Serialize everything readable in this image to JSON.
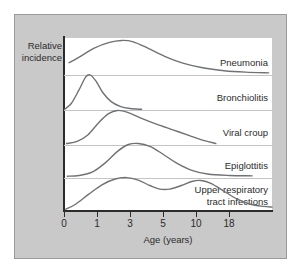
{
  "figure": {
    "background_color": "#c9c9c9",
    "panel_color": "#ffffff",
    "axis_color": "#2b2b2b",
    "curve_color": "#6f7275",
    "separator_color": "#c4c4c4"
  },
  "chart_data": {
    "type": "line",
    "title": "",
    "xlabel": "Age (years)",
    "ylabel_line1": "Relative",
    "ylabel_line2": "incidence",
    "grid": false,
    "legend_position": "right-inline",
    "x_tick_labels": [
      "0",
      "1",
      "3",
      "5",
      "10",
      "18"
    ],
    "x_tick_positions": [
      0,
      1,
      2,
      3,
      4,
      5
    ],
    "xlim": [
      0,
      6.3
    ],
    "ylim": [
      0,
      1
    ],
    "note": "Ridgeline of five age-incidence curves; x axis uses non-linear spacing with evenly spaced labels 0,1,3,5,10,18",
    "series": [
      {
        "name": "Pneumonia",
        "label": "Pneumonia",
        "band": 1,
        "peak_x_label": "2",
        "points": [
          {
            "x": 0.15,
            "y": 0.34
          },
          {
            "x": 0.5,
            "y": 0.52
          },
          {
            "x": 0.9,
            "y": 0.74
          },
          {
            "x": 1.35,
            "y": 0.9
          },
          {
            "x": 1.75,
            "y": 0.96
          },
          {
            "x": 2.1,
            "y": 0.92
          },
          {
            "x": 2.55,
            "y": 0.74
          },
          {
            "x": 3.05,
            "y": 0.52
          },
          {
            "x": 3.6,
            "y": 0.33
          },
          {
            "x": 4.2,
            "y": 0.2
          },
          {
            "x": 4.85,
            "y": 0.12
          },
          {
            "x": 5.5,
            "y": 0.08
          },
          {
            "x": 6.2,
            "y": 0.06
          }
        ]
      },
      {
        "name": "Bronchiolitis",
        "label": "Bronchiolitis",
        "band": 2,
        "peak_x_label": "under 1",
        "points": [
          {
            "x": 0.02,
            "y": 0.02
          },
          {
            "x": 0.22,
            "y": 0.18
          },
          {
            "x": 0.45,
            "y": 0.55
          },
          {
            "x": 0.66,
            "y": 0.92
          },
          {
            "x": 0.8,
            "y": 0.97
          },
          {
            "x": 0.97,
            "y": 0.8
          },
          {
            "x": 1.18,
            "y": 0.48
          },
          {
            "x": 1.42,
            "y": 0.24
          },
          {
            "x": 1.7,
            "y": 0.1
          },
          {
            "x": 2.0,
            "y": 0.04
          },
          {
            "x": 2.35,
            "y": 0.02
          }
        ]
      },
      {
        "name": "Viral croup",
        "label": "Viral croup",
        "band": 3,
        "peak_x_label": "2",
        "points": [
          {
            "x": 0.08,
            "y": 0.04
          },
          {
            "x": 0.4,
            "y": 0.1
          },
          {
            "x": 0.72,
            "y": 0.28
          },
          {
            "x": 1.05,
            "y": 0.62
          },
          {
            "x": 1.35,
            "y": 0.87
          },
          {
            "x": 1.62,
            "y": 0.96
          },
          {
            "x": 1.95,
            "y": 0.9
          },
          {
            "x": 2.35,
            "y": 0.74
          },
          {
            "x": 2.8,
            "y": 0.58
          },
          {
            "x": 3.3,
            "y": 0.42
          },
          {
            "x": 3.8,
            "y": 0.26
          },
          {
            "x": 4.25,
            "y": 0.12
          },
          {
            "x": 4.6,
            "y": 0.04
          }
        ]
      },
      {
        "name": "Epiglottitis",
        "label": "Epiglottitis",
        "band": 4,
        "peak_x_label": "3",
        "points": [
          {
            "x": 0.1,
            "y": 0.05
          },
          {
            "x": 0.45,
            "y": 0.07
          },
          {
            "x": 0.85,
            "y": 0.16
          },
          {
            "x": 1.25,
            "y": 0.42
          },
          {
            "x": 1.62,
            "y": 0.74
          },
          {
            "x": 1.95,
            "y": 0.93
          },
          {
            "x": 2.25,
            "y": 0.96
          },
          {
            "x": 2.6,
            "y": 0.88
          },
          {
            "x": 3.0,
            "y": 0.66
          },
          {
            "x": 3.4,
            "y": 0.42
          },
          {
            "x": 3.85,
            "y": 0.22
          },
          {
            "x": 4.35,
            "y": 0.11
          },
          {
            "x": 5.0,
            "y": 0.07
          },
          {
            "x": 5.7,
            "y": 0.06
          }
        ]
      },
      {
        "name": "Upper respiratory tract infections",
        "label_line1": "Upper respiratory",
        "label_line2": "tract infections",
        "band": 5,
        "peak_x_label": "bimodal: 3 and 10",
        "points": [
          {
            "x": 0.05,
            "y": 0.02
          },
          {
            "x": 0.35,
            "y": 0.16
          },
          {
            "x": 0.75,
            "y": 0.44
          },
          {
            "x": 1.15,
            "y": 0.7
          },
          {
            "x": 1.55,
            "y": 0.86
          },
          {
            "x": 1.9,
            "y": 0.9
          },
          {
            "x": 2.25,
            "y": 0.83
          },
          {
            "x": 2.6,
            "y": 0.68
          },
          {
            "x": 2.9,
            "y": 0.58
          },
          {
            "x": 3.2,
            "y": 0.58
          },
          {
            "x": 3.55,
            "y": 0.68
          },
          {
            "x": 3.9,
            "y": 0.8
          },
          {
            "x": 4.15,
            "y": 0.82
          },
          {
            "x": 4.45,
            "y": 0.74
          },
          {
            "x": 4.85,
            "y": 0.52
          },
          {
            "x": 5.25,
            "y": 0.3
          },
          {
            "x": 5.65,
            "y": 0.16
          },
          {
            "x": 6.05,
            "y": 0.1
          },
          {
            "x": 6.3,
            "y": 0.08
          }
        ]
      }
    ]
  }
}
